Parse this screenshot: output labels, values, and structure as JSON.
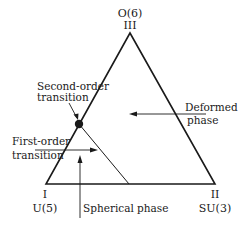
{
  "diagram": {
    "vertices": {
      "top": {
        "roman": "III",
        "symmetry": "O(6)"
      },
      "left": {
        "roman": "I",
        "symmetry": "U(5)"
      },
      "right": {
        "roman": "II",
        "symmetry": "SU(3)"
      }
    },
    "labels": {
      "second_order_line1": "Second-order",
      "second_order_line2": "transition",
      "first_order_line1": "First-order",
      "first_order_line2": "transition",
      "deformed_line1": "Deformed",
      "deformed_line2": "phase",
      "spherical": "Spherical phase"
    },
    "colors": {
      "line": "#1a1a1a",
      "background": "#ffffff"
    }
  }
}
